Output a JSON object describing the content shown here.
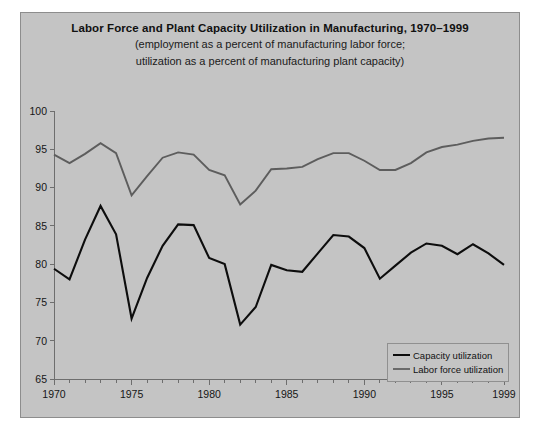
{
  "chart_data": {
    "type": "line",
    "title": "Labor Force and Plant Capacity Utilization in Manufacturing, 1970–1999",
    "subtitle_line1": "(employment as a percent of manufacturing labor force;",
    "subtitle_line2": "utilization as a percent of manufacturing plant capacity)",
    "xlabel": "",
    "ylabel": "",
    "xlim": [
      1970,
      1999
    ],
    "ylim": [
      65,
      100
    ],
    "grid": false,
    "legend_position": "bottom-right",
    "y_ticks": [
      65,
      70,
      75,
      80,
      85,
      90,
      95,
      100
    ],
    "y_tick_labels": [
      "65",
      "70",
      "75",
      "80",
      "85",
      "90",
      "95",
      "100"
    ],
    "x_ticks": [
      1970,
      1971,
      1972,
      1973,
      1974,
      1975,
      1976,
      1977,
      1978,
      1979,
      1980,
      1981,
      1982,
      1983,
      1984,
      1985,
      1986,
      1987,
      1988,
      1989,
      1990,
      1991,
      1992,
      1993,
      1994,
      1995,
      1996,
      1997,
      1998,
      1999
    ],
    "x_tick_labels_shown": [
      "1970",
      "1975",
      "1980",
      "1985",
      "1990",
      "1995",
      "1999"
    ],
    "x_labeled_ticks": [
      1970,
      1975,
      1980,
      1985,
      1990,
      1995,
      1999
    ],
    "x": [
      1970,
      1971,
      1972,
      1973,
      1974,
      1975,
      1976,
      1977,
      1978,
      1979,
      1980,
      1981,
      1982,
      1983,
      1984,
      1985,
      1986,
      1987,
      1988,
      1989,
      1990,
      1991,
      1992,
      1993,
      1994,
      1995,
      1996,
      1997,
      1998,
      1999
    ],
    "series": [
      {
        "name": "Capacity utilization",
        "color": "#0d0d0d",
        "values": [
          79.4,
          78.0,
          83.2,
          87.6,
          83.9,
          72.9,
          78.2,
          82.4,
          85.2,
          85.1,
          80.8,
          80.0,
          72.1,
          74.4,
          79.9,
          79.2,
          79.0,
          81.4,
          83.8,
          83.6,
          82.1,
          78.1,
          79.8,
          81.5,
          82.7,
          82.4,
          81.3,
          82.6,
          81.4,
          79.9
        ]
      },
      {
        "name": "Labor force utilization",
        "color": "#5d5d5d",
        "values": [
          94.3,
          93.2,
          94.4,
          95.8,
          94.5,
          89.0,
          91.5,
          93.9,
          94.6,
          94.3,
          92.3,
          91.6,
          87.8,
          89.6,
          92.4,
          92.5,
          92.7,
          93.7,
          94.5,
          94.5,
          93.5,
          92.3,
          92.3,
          93.2,
          94.6,
          95.3,
          95.6,
          96.1,
          96.4,
          96.5
        ]
      }
    ]
  },
  "legend": {
    "items": [
      {
        "label": "Capacity utilization"
      },
      {
        "label": "Labor force utilization"
      }
    ]
  },
  "colors": {
    "panel_background": "#c4c4c4",
    "page_background": "#ffffff",
    "axis": "#6e6e6e",
    "capacity_line": "#0d0d0d",
    "labor_line": "#5d5d5d"
  }
}
